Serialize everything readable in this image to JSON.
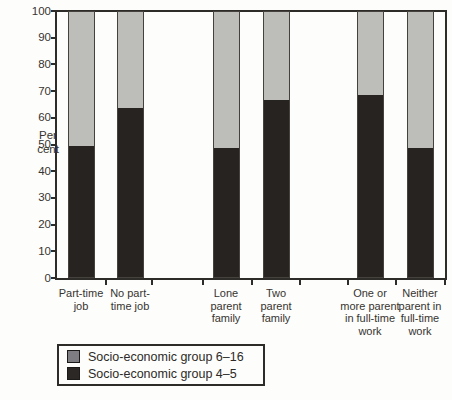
{
  "figure": {
    "kind": "stacked-bar-chart-scan",
    "background": "#fdfdfb"
  },
  "chart_data": {
    "type": "bar",
    "stacked": true,
    "title": "",
    "xlabel": "",
    "ylabel": "Per cent",
    "ylabel_lines": [
      "Per",
      "cent"
    ],
    "ylim": [
      0,
      100
    ],
    "yticks": [
      0,
      10,
      20,
      30,
      40,
      50,
      60,
      70,
      80,
      90,
      100
    ],
    "grid": false,
    "frame": "closed-top-and-right",
    "categories": [
      {
        "label": "Part-time job",
        "lines": [
          "Part-time",
          "job"
        ]
      },
      {
        "label": "No part-time job",
        "lines": [
          "No part-",
          "time job"
        ]
      },
      {
        "label": "Lone parent family",
        "lines": [
          "Lone",
          "parent",
          "family"
        ]
      },
      {
        "label": "Two parent family",
        "lines": [
          "Two",
          "parent",
          "family"
        ]
      },
      {
        "label": "One or more parent in full-time work",
        "lines": [
          "One or",
          "more parent",
          "in full-time",
          "work"
        ]
      },
      {
        "label": "Neither parent in full-time work",
        "lines": [
          "Neither",
          "parent in",
          "full-time",
          "work"
        ]
      }
    ],
    "category_groups": [
      [
        "Part-time job",
        "No part-time job"
      ],
      [
        "Lone parent family",
        "Two parent family"
      ],
      [
        "One or more parent in full-time work",
        "Neither parent in full-time work"
      ]
    ],
    "series": [
      {
        "name": "Socio-economic group 4–5",
        "stack_position": "bottom",
        "color": "#272320",
        "values": [
          50,
          64,
          49,
          67,
          69,
          49
        ]
      },
      {
        "name": "Socio-economic group 6–16",
        "stack_position": "top",
        "color": "#bdbdb9",
        "values": [
          50,
          36,
          51,
          33,
          31,
          51
        ]
      }
    ],
    "legend": {
      "position": "bottom-left",
      "entries": [
        {
          "label": "Socio-economic group 6–16",
          "swatch_color": "#7e7e82"
        },
        {
          "label": "Socio-economic group 4–5",
          "swatch_color": "#2b2825"
        }
      ]
    }
  }
}
